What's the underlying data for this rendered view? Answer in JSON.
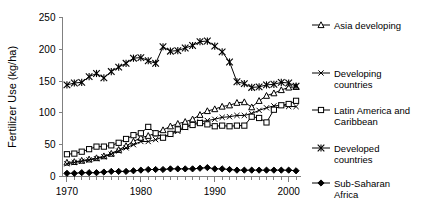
{
  "chart_data": {
    "type": "line",
    "title": "",
    "xlabel": "",
    "ylabel": "Fertilizer Use (kg/ha)",
    "xlim": [
      1969.4,
      2001.6
    ],
    "ylim": [
      0,
      250
    ],
    "xticks": [
      1970,
      1980,
      1990,
      2000
    ],
    "xtick_labels": [
      "1970",
      "1980",
      "1990",
      "2000"
    ],
    "yticks": [
      0,
      50,
      100,
      150,
      200,
      250
    ],
    "ytick_labels": [
      "0",
      "50",
      "100",
      "150",
      "200",
      "250"
    ],
    "minor_xticks_every": 1,
    "grid": false,
    "legend_position": "right",
    "x": [
      1970,
      1971,
      1972,
      1973,
      1974,
      1975,
      1976,
      1977,
      1978,
      1979,
      1980,
      1981,
      1982,
      1983,
      1984,
      1985,
      1986,
      1987,
      1988,
      1989,
      1990,
      1991,
      1992,
      1993,
      1994,
      1995,
      1996,
      1997,
      1998,
      1999,
      2000,
      2001
    ],
    "series": [
      {
        "name": "Asia developing",
        "marker": "triangle-open",
        "values": [
          22,
          23,
          25,
          27,
          29,
          32,
          36,
          42,
          48,
          55,
          61,
          64,
          68,
          73,
          79,
          83,
          86,
          90,
          97,
          103,
          106,
          110,
          112,
          116,
          117,
          109,
          119,
          127,
          131,
          136,
          140,
          141
        ]
      },
      {
        "name": "Developing countries",
        "marker": "x-mark",
        "values": [
          20,
          22,
          24,
          26,
          28,
          31,
          35,
          40,
          45,
          50,
          55,
          55,
          58,
          62,
          66,
          71,
          77,
          82,
          86,
          88,
          90,
          93,
          94,
          96,
          96,
          99,
          104,
          108,
          111,
          112,
          110,
          110
        ]
      },
      {
        "name": "Latin America and Caribbean",
        "marker": "square-open",
        "values": [
          35,
          36,
          39,
          43,
          47,
          47,
          49,
          53,
          59,
          65,
          68,
          78,
          68,
          61,
          67,
          74,
          78,
          81,
          84,
          82,
          79,
          80,
          79,
          80,
          80,
          94,
          92,
          85,
          105,
          112,
          114,
          119
        ]
      },
      {
        "name": "Developed countries",
        "marker": "asterisk",
        "values": [
          144,
          147,
          148,
          157,
          162,
          155,
          165,
          172,
          178,
          186,
          187,
          182,
          178,
          204,
          197,
          198,
          202,
          206,
          212,
          213,
          205,
          196,
          180,
          149,
          146,
          140,
          141,
          144,
          145,
          148,
          147,
          142
        ]
      },
      {
        "name": "Sub-Saharan Africa",
        "marker": "diamond-solid",
        "values": [
          5,
          5,
          6,
          6,
          6,
          7,
          8,
          8,
          8,
          9,
          10,
          11,
          11,
          11,
          12,
          12,
          12,
          12,
          13,
          14,
          12,
          12,
          11,
          10,
          10,
          10,
          10,
          10,
          10,
          10,
          10,
          9
        ]
      }
    ]
  },
  "legend": {
    "entries": [
      {
        "label_line1": "Asia developing",
        "label_line2": ""
      },
      {
        "label_line1": "Developing",
        "label_line2": "countries"
      },
      {
        "label_line1": "Latin America and",
        "label_line2": "Caribbean"
      },
      {
        "label_line1": "Developed",
        "label_line2": "countries"
      },
      {
        "label_line1": "Sub-Saharan",
        "label_line2": "Africa"
      }
    ]
  },
  "colors": {
    "line": "#000000",
    "axis": "#808080",
    "background": "#ffffff",
    "marker_fill_open": "#ffffff",
    "marker_fill_solid": "#000000"
  }
}
